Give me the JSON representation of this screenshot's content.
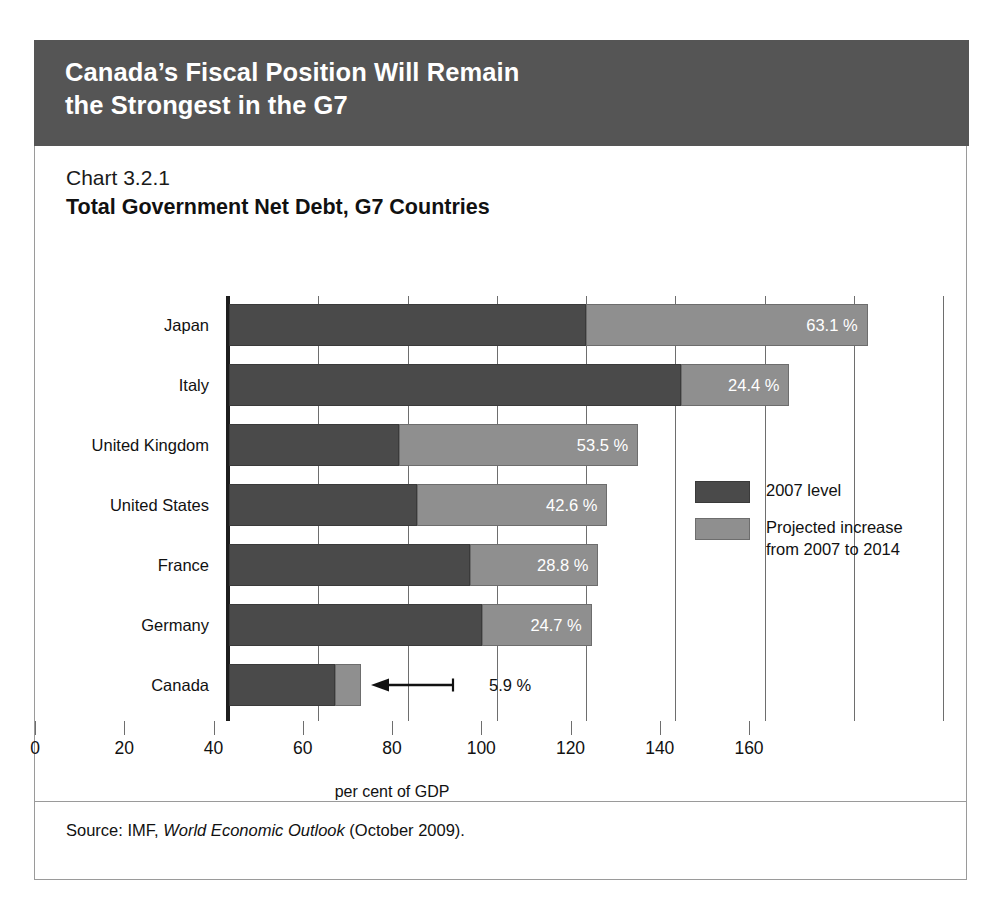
{
  "banner": {
    "title": "Canada’s Fiscal Position Will Remain\nthe Strongest in the G7"
  },
  "chart_header": {
    "number": "Chart 3.2.1",
    "title": "Total Government Net Debt, G7 Countries"
  },
  "source": {
    "prefix": "Source: IMF, ",
    "italic": "World Economic Outlook",
    "suffix": " (October 2009)."
  },
  "legend": {
    "items": [
      {
        "label": "2007 level",
        "color": "#4a4a4a"
      },
      {
        "label": "Projected increase\nfrom 2007 to 2014",
        "color": "#8f8f8f"
      }
    ]
  },
  "chart_data": {
    "type": "bar",
    "orientation": "horizontal",
    "stacked": true,
    "title": "Total Government Net Debt, G7 Countries",
    "subtitle": "Chart 3.2.1",
    "xlabel": "per cent of GDP",
    "ylabel": "",
    "xlim": [
      0,
      160
    ],
    "xticks": [
      0,
      20,
      40,
      60,
      80,
      100,
      120,
      140,
      160
    ],
    "xticklabels": [
      "0",
      "20",
      "40",
      "60",
      "80",
      "100",
      "120",
      "140",
      "160"
    ],
    "grid": true,
    "grid_axis": "x",
    "legend_position": "center-right",
    "categories": [
      "Japan",
      "Italy",
      "United Kingdom",
      "United States",
      "France",
      "Germany",
      "Canada"
    ],
    "series": [
      {
        "name": "2007 level",
        "color": "#4a4a4a",
        "values": [
          80.0,
          101.2,
          38.2,
          42.2,
          54.0,
          56.6,
          23.7
        ]
      },
      {
        "name": "Projected increase from 2007 to 2014",
        "color": "#8f8f8f",
        "values": [
          63.1,
          24.4,
          53.5,
          42.6,
          28.8,
          24.7,
          5.9
        ]
      }
    ],
    "totals": [
      143.1,
      125.6,
      91.7,
      84.8,
      82.8,
      81.3,
      29.6
    ],
    "data_labels": [
      "63.1 %",
      "24.4 %",
      "53.5 %",
      "42.6 %",
      "28.8 %",
      "24.7 %",
      "5.9 %"
    ],
    "data_label_placement": [
      "inside",
      "inside",
      "inside",
      "inside",
      "inside",
      "inside",
      "outside-callout"
    ]
  }
}
